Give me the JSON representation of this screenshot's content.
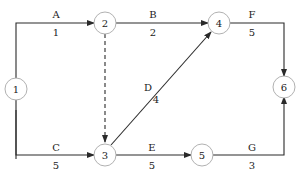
{
  "diagram": {
    "type": "activity-on-arrow network",
    "nodes": [
      {
        "id": "1",
        "label": "1"
      },
      {
        "id": "2",
        "label": "2"
      },
      {
        "id": "3",
        "label": "3"
      },
      {
        "id": "4",
        "label": "4"
      },
      {
        "id": "5",
        "label": "5"
      },
      {
        "id": "6",
        "label": "6"
      }
    ],
    "edges": [
      {
        "from": "1",
        "to": "2",
        "activity": "A",
        "duration": "1"
      },
      {
        "from": "2",
        "to": "4",
        "activity": "B",
        "duration": "2"
      },
      {
        "from": "1",
        "to": "3",
        "activity": "C",
        "duration": "5"
      },
      {
        "from": "3",
        "to": "4",
        "activity": "D",
        "duration": "4"
      },
      {
        "from": "3",
        "to": "5",
        "activity": "E",
        "duration": "5"
      },
      {
        "from": "4",
        "to": "6",
        "activity": "F",
        "duration": "5"
      },
      {
        "from": "5",
        "to": "6",
        "activity": "G",
        "duration": "3"
      },
      {
        "from": "2",
        "to": "3",
        "activity": "",
        "duration": "",
        "dummy": true
      }
    ]
  }
}
